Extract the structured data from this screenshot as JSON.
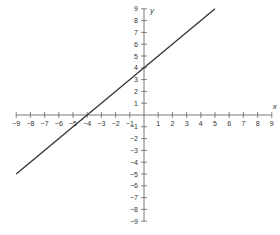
{
  "chart_data": {
    "type": "line",
    "title": "",
    "xlabel": "x",
    "ylabel": "y",
    "xlim": [
      -9,
      9
    ],
    "ylim": [
      -9,
      9
    ],
    "grid": false,
    "legend": null,
    "x_ticks": [
      -9,
      -8,
      -7,
      -6,
      -5,
      -4,
      -3,
      -2,
      -1,
      1,
      2,
      3,
      4,
      5,
      6,
      7,
      8,
      9
    ],
    "y_ticks": [
      9,
      8,
      7,
      6,
      5,
      4,
      3,
      2,
      1,
      -1,
      -2,
      -3,
      -4,
      -5,
      -6,
      -7,
      -8,
      -9
    ],
    "series": [
      {
        "name": "y = x + 4",
        "x": [
          -9,
          5
        ],
        "y": [
          -5,
          9
        ],
        "color": "#333333"
      }
    ]
  },
  "colors": {
    "axis": "#555555",
    "line": "#333333",
    "background": "#ffffff"
  }
}
